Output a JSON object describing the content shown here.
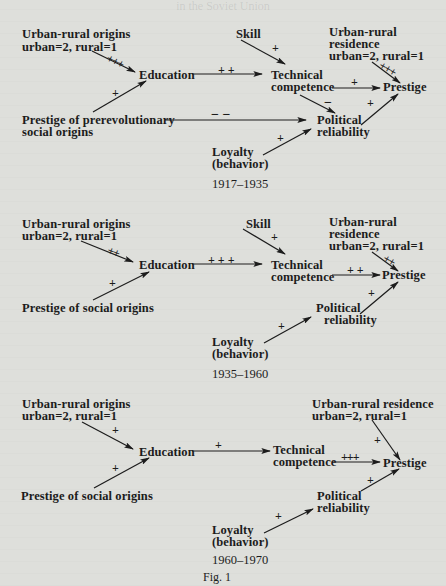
{
  "header": {
    "running_title": "in the Soviet Union"
  },
  "figure_caption": "Fig. 1",
  "panels": [
    {
      "period": "1917–1935",
      "nodes": {
        "urban_rural_origins": {
          "line1": "Urban-rural origins",
          "line2": "urban=2, rural=1"
        },
        "prestige_social_origins": {
          "line1": "Prestige of prerevolutionary",
          "line2": "social origins"
        },
        "education": "Education",
        "skill": "Skill",
        "technical_competence": {
          "line1": "Technical",
          "line2": "competence"
        },
        "urban_rural_residence": {
          "line1": "Urban-rural",
          "line2": "residence",
          "line3": "urban=2, rural=1"
        },
        "prestige": "Prestige",
        "political_reliability": {
          "line1": "Political",
          "line2": "reliability"
        },
        "loyalty": {
          "line1": "Loyalty",
          "line2": "(behavior)"
        }
      },
      "edges": [
        {
          "from": "Urban-rural origins",
          "to": "Education",
          "sign": "+++"
        },
        {
          "from": "Prestige of prerevolutionary social origins",
          "to": "Education",
          "sign": "+"
        },
        {
          "from": "Education",
          "to": "Technical competence",
          "sign": "++"
        },
        {
          "from": "Skill",
          "to": "Technical competence",
          "sign": "+"
        },
        {
          "from": "Urban-rural residence",
          "to": "Prestige",
          "sign": "+++"
        },
        {
          "from": "Technical competence",
          "to": "Prestige",
          "sign": "+"
        },
        {
          "from": "Technical competence",
          "to": "Political reliability",
          "sign": "−"
        },
        {
          "from": "Prestige of prerevolutionary social origins",
          "to": "Political reliability",
          "sign": "−−"
        },
        {
          "from": "Political reliability",
          "to": "Prestige",
          "sign": "+"
        },
        {
          "from": "Loyalty (behavior)",
          "to": "Political reliability",
          "sign": "+"
        }
      ],
      "sign_labels": {
        "origins_edu": "+ + +",
        "social_edu": "+",
        "edu_tech": "+ +",
        "skill_tech": "+",
        "residence_prestige": "+ + +",
        "tech_prestige": "+",
        "tech_political": "−",
        "social_political": "− −",
        "political_prestige": "+",
        "loyalty_political": "+"
      }
    },
    {
      "period": "1935–1960",
      "nodes": {
        "urban_rural_origins": {
          "line1": "Urban-rural origins",
          "line2": "urban=2, rural=1"
        },
        "prestige_social_origins": {
          "line1": "Prestige of social origins"
        },
        "education": "Education",
        "skill": "Skill",
        "technical_competence": {
          "line1": "Technical",
          "line2": "competence"
        },
        "urban_rural_residence": {
          "line1": "Urban-rural",
          "line2": "residence",
          "line3": "urban=2, rural=1"
        },
        "prestige": "Prestige",
        "political_reliability": {
          "line1": "Political",
          "line2": "reliability"
        },
        "loyalty": {
          "line1": "Loyalty",
          "line2": "(behavior)"
        }
      },
      "edges": [
        {
          "from": "Urban-rural origins",
          "to": "Education",
          "sign": "++"
        },
        {
          "from": "Prestige of social origins",
          "to": "Education",
          "sign": "+"
        },
        {
          "from": "Education",
          "to": "Technical competence",
          "sign": "+++"
        },
        {
          "from": "Skill",
          "to": "Technical competence",
          "sign": "+"
        },
        {
          "from": "Urban-rural residence",
          "to": "Prestige",
          "sign": "++"
        },
        {
          "from": "Technical competence",
          "to": "Prestige",
          "sign": "++"
        },
        {
          "from": "Political reliability",
          "to": "Prestige",
          "sign": "+"
        },
        {
          "from": "Loyalty (behavior)",
          "to": "Political reliability",
          "sign": "+"
        }
      ],
      "sign_labels": {
        "origins_edu": "+ +",
        "social_edu": "+",
        "edu_tech": "+ + +",
        "skill_tech": "+",
        "residence_prestige": "+ +",
        "tech_prestige": "+ +",
        "political_prestige": "+",
        "loyalty_political": "+"
      }
    },
    {
      "period": "1960–1970",
      "nodes": {
        "urban_rural_origins": {
          "line1": "Urban-rural origins",
          "line2": "urban=2, rural=1"
        },
        "prestige_social_origins": {
          "line1": "Prestige of social origins"
        },
        "education": "Education",
        "technical_competence": {
          "line1": "Technical",
          "line2": "competence"
        },
        "urban_rural_residence": {
          "line1": "Urban-rural residence",
          "line2": "urban=2, rural=1"
        },
        "prestige": "Prestige",
        "political_reliability": {
          "line1": "Political",
          "line2": "reliability"
        },
        "loyalty": {
          "line1": "Loyalty",
          "line2": "(behavior)"
        }
      },
      "edges": [
        {
          "from": "Urban-rural origins",
          "to": "Education",
          "sign": "+"
        },
        {
          "from": "Prestige of social origins",
          "to": "Education",
          "sign": "+"
        },
        {
          "from": "Education",
          "to": "Technical competence",
          "sign": "+"
        },
        {
          "from": "Urban-rural residence",
          "to": "Prestige",
          "sign": "+"
        },
        {
          "from": "Technical competence",
          "to": "Prestige",
          "sign": "+++"
        },
        {
          "from": "Political reliability",
          "to": "Prestige",
          "sign": "+"
        },
        {
          "from": "Loyalty (behavior)",
          "to": "Political reliability",
          "sign": "+"
        }
      ],
      "sign_labels": {
        "origins_edu": "+",
        "social_edu": "+",
        "edu_tech": "+",
        "residence_prestige": "+",
        "tech_prestige": "+++",
        "political_prestige": "+",
        "loyalty_political": "+"
      }
    }
  ]
}
